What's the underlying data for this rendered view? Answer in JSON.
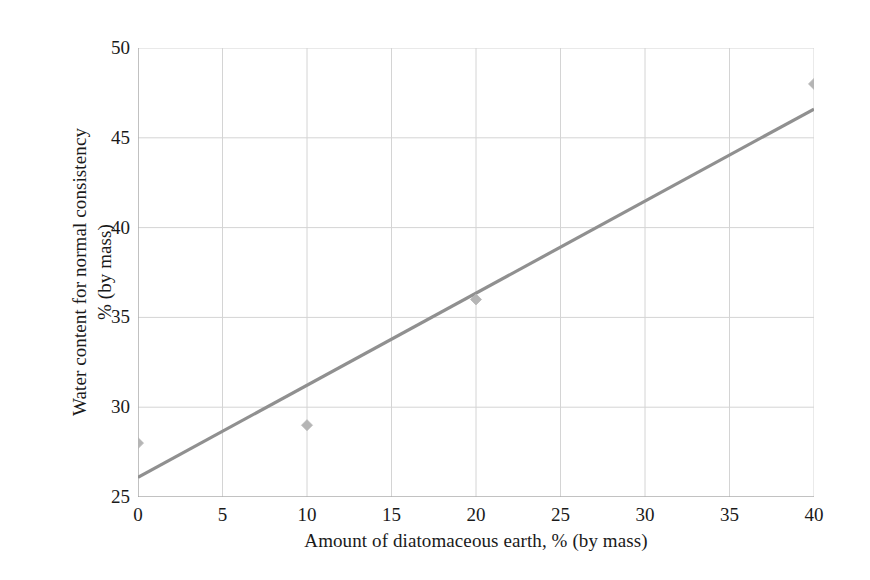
{
  "chart_data": {
    "type": "scatter",
    "title": "",
    "xlabel": "Amount of diatomaceous earth, % (by mass)",
    "ylabel_line1": "Water content for normal consistency",
    "ylabel_line2": "% (by mass)",
    "xlim": [
      0,
      40
    ],
    "ylim": [
      25,
      50
    ],
    "xticks": [
      0,
      5,
      10,
      15,
      20,
      25,
      30,
      35,
      40
    ],
    "yticks": [
      25,
      30,
      35,
      40,
      45,
      50
    ],
    "xtick_labels": [
      "0",
      "5",
      "10",
      "15",
      "20",
      "25",
      "30",
      "35",
      "40"
    ],
    "ytick_labels": [
      "25",
      "30",
      "35",
      "40",
      "45",
      "50"
    ],
    "grid": true,
    "legend": null,
    "series": [
      {
        "name": "Water content for normal consistency",
        "marker": "diamond",
        "x": [
          0,
          10,
          20,
          40
        ],
        "y": [
          28,
          29,
          36,
          48
        ],
        "points": [
          {
            "x": 0,
            "y": 28
          },
          {
            "x": 10,
            "y": 29
          },
          {
            "x": 20,
            "y": 36
          },
          {
            "x": 40,
            "y": 48
          }
        ]
      },
      {
        "name": "linear trendline",
        "type": "line",
        "x": [
          0,
          40
        ],
        "y": [
          26.1,
          46.6
        ]
      }
    ],
    "colors": {
      "marker": "#b5b5b5",
      "trendline": "#909090",
      "grid": "#d4d4d4",
      "axis": "#9a9a9a",
      "text": "#1a1a1a",
      "background": "#ffffff"
    }
  }
}
